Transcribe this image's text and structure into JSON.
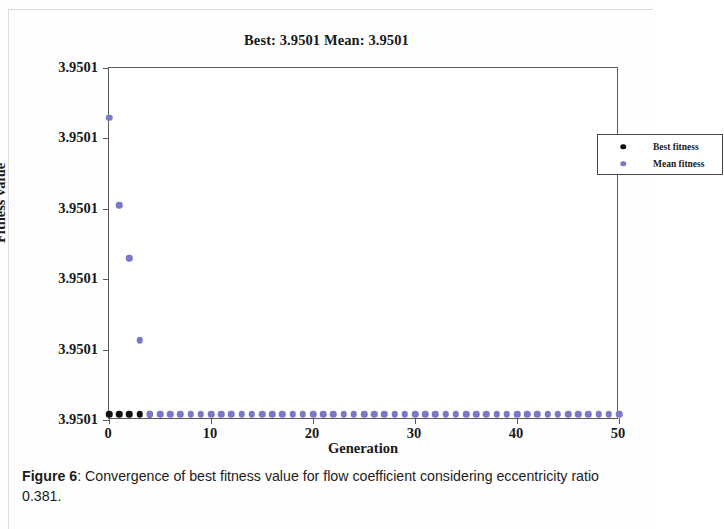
{
  "figure": {
    "chart_title": "Best: 3.9501 Mean: 3.9501",
    "caption_label": "Figure 6",
    "caption_separator": ": ",
    "caption_text": "Convergence of best fitness value for flow coefficient considering eccentricity ratio 0.381."
  },
  "colors": {
    "best_fitness": "#101010",
    "mean_fitness": "#7b78c8",
    "axis": "#5a5a5a",
    "text": "#1a1a1a"
  },
  "chart_data": {
    "type": "scatter",
    "title": "Best: 3.9501 Mean: 3.9501",
    "xlabel": "Generation",
    "ylabel": "Fitness value",
    "xlim": [
      0,
      50
    ],
    "ylim": [
      3.9501,
      3.95016
    ],
    "grid": false,
    "legend_position": "top-right",
    "xticks": [
      0,
      10,
      20,
      30,
      40,
      50
    ],
    "xtick_labels": [
      "0",
      "10",
      "20",
      "30",
      "40",
      "50"
    ],
    "yticks": [
      3.9501,
      3.950112,
      3.950124,
      3.950136,
      3.950148,
      3.95016
    ],
    "ytick_labels": [
      "3.9501",
      "3.9501",
      "3.9501",
      "3.9501",
      "3.9501",
      "3.9501"
    ],
    "series": [
      {
        "name": "Best fitness",
        "color": "#101010",
        "marker": "circle",
        "x": [
          0,
          1,
          2,
          3,
          4
        ],
        "values": [
          3.950101,
          3.950101,
          3.950101,
          3.950101,
          3.950101
        ]
      },
      {
        "name": "Mean fitness",
        "color": "#7b78c8",
        "marker": "circle",
        "x": [
          0,
          1,
          2,
          3,
          4,
          5,
          6,
          7,
          8,
          9,
          10,
          11,
          12,
          13,
          14,
          15,
          16,
          17,
          18,
          19,
          20,
          21,
          22,
          23,
          24,
          25,
          26,
          27,
          28,
          29,
          30,
          31,
          32,
          33,
          34,
          35,
          36,
          37,
          38,
          39,
          40,
          41,
          42,
          43,
          44,
          45,
          46,
          47,
          48,
          49,
          50
        ],
        "values": [
          3.9501515,
          3.9501366,
          3.9501276,
          3.9501136,
          3.950101,
          3.950101,
          3.950101,
          3.950101,
          3.950101,
          3.950101,
          3.950101,
          3.950101,
          3.950101,
          3.950101,
          3.950101,
          3.950101,
          3.950101,
          3.950101,
          3.950101,
          3.950101,
          3.950101,
          3.950101,
          3.950101,
          3.950101,
          3.950101,
          3.950101,
          3.950101,
          3.950101,
          3.950101,
          3.950101,
          3.950101,
          3.950101,
          3.950101,
          3.950101,
          3.950101,
          3.950101,
          3.950101,
          3.950101,
          3.950101,
          3.950101,
          3.950101,
          3.950101,
          3.950101,
          3.950101,
          3.950101,
          3.950101,
          3.950101,
          3.950101,
          3.950101,
          3.950101,
          3.950101
        ]
      }
    ],
    "legend": [
      {
        "label": "Best fitness",
        "color": "#101010"
      },
      {
        "label": "Mean fitness",
        "color": "#7b78c8"
      }
    ]
  }
}
